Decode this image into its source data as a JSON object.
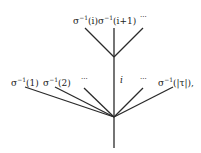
{
  "diagram": {
    "type": "tree",
    "line_color": "#2a2a2a",
    "upper_node": {
      "labels": [
        {
          "base": "σ",
          "sup": "−1",
          "arg": "(i)"
        },
        {
          "base": "σ",
          "sup": "−1",
          "arg": "(i+1)"
        },
        {
          "text": "···"
        }
      ]
    },
    "lower_node": {
      "labels": [
        {
          "base": "σ",
          "sup": "−1",
          "arg": "(1)"
        },
        {
          "base": "σ",
          "sup": "−1",
          "arg": "(2)"
        },
        {
          "text": "···"
        },
        {
          "text": "i"
        },
        {
          "text": "···"
        },
        {
          "base": "σ",
          "sup": "−1",
          "arg": "(|τ|),"
        }
      ]
    }
  }
}
